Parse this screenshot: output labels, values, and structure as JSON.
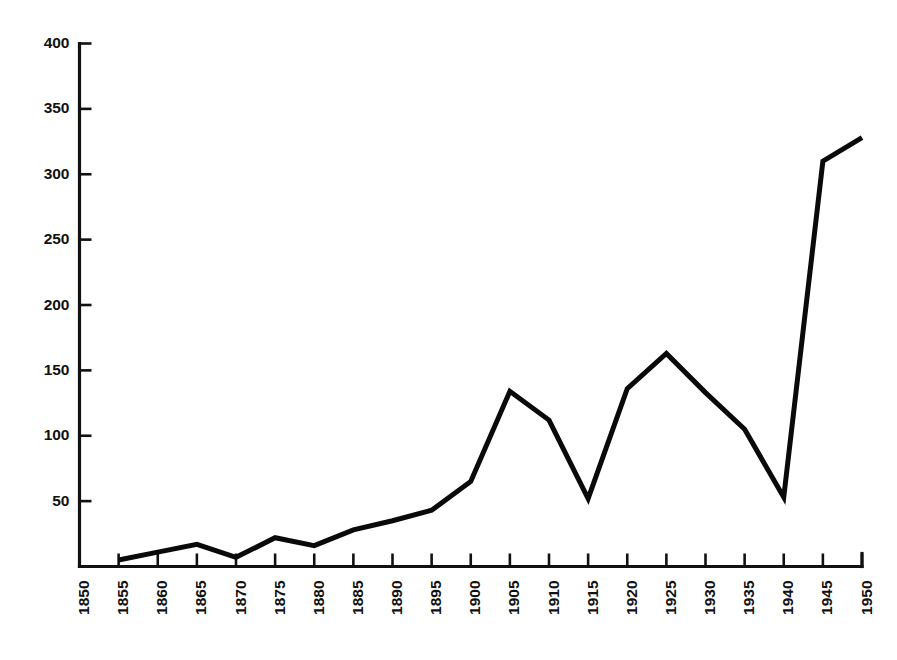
{
  "chart_data": {
    "type": "line",
    "title": "",
    "subtitle": "",
    "xlabel": "",
    "ylabel": "",
    "xlim": [
      1850,
      1950
    ],
    "ylim": [
      0,
      400
    ],
    "grid": false,
    "legend": null,
    "x_tick_labels": [
      "1850",
      "1855",
      "1860",
      "1865",
      "1870",
      "1875",
      "1880",
      "1885",
      "1890",
      "1895",
      "1900",
      "1905",
      "1910",
      "1915",
      "1920",
      "1925",
      "1930",
      "1935",
      "1940",
      "1945",
      "1950"
    ],
    "y_tick_labels": [
      "50",
      "100",
      "150",
      "200",
      "250",
      "300",
      "350",
      "400"
    ],
    "y_tick_values": [
      50,
      100,
      150,
      200,
      250,
      300,
      350,
      400
    ],
    "x": [
      1855,
      1860,
      1865,
      1870,
      1875,
      1880,
      1885,
      1890,
      1895,
      1900,
      1905,
      1910,
      1915,
      1920,
      1925,
      1930,
      1935,
      1940,
      1945,
      1950
    ],
    "values": [
      5,
      11,
      17,
      7,
      22,
      16,
      28,
      35,
      43,
      65,
      134,
      112,
      52,
      136,
      163,
      133,
      105,
      53,
      310,
      328
    ],
    "series": [
      {
        "name": "series-1",
        "color": "#0a0a0a",
        "x": [
          1855,
          1860,
          1865,
          1870,
          1875,
          1880,
          1885,
          1890,
          1895,
          1900,
          1905,
          1910,
          1915,
          1920,
          1925,
          1930,
          1935,
          1940,
          1945,
          1950
        ],
        "values": [
          5,
          11,
          17,
          7,
          22,
          16,
          28,
          35,
          43,
          65,
          134,
          112,
          52,
          136,
          163,
          133,
          105,
          53,
          310,
          328
        ]
      }
    ],
    "annotations": []
  },
  "style": {
    "background": "#ffffff",
    "axis_color": "#111111",
    "line_color": "#0a0a0a"
  }
}
